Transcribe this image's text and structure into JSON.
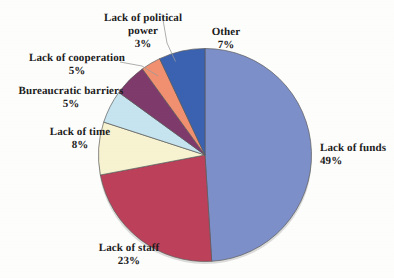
{
  "chart_data": {
    "type": "pie",
    "title": "",
    "subtitle": "",
    "xlabel": "",
    "ylabel": "",
    "legend_position": "none",
    "grid": false,
    "labels_show_percent": true,
    "start_angle_deg": 0,
    "direction": "clockwise",
    "categories": [
      "Lack of funds",
      "Lack of staff",
      "Lack of time",
      "Bureaucratic barriers",
      "Lack of cooperation",
      "Lack of political power",
      "Other"
    ],
    "values": [
      49,
      23,
      8,
      5,
      5,
      3,
      7
    ],
    "unit": "%",
    "total": 100,
    "slices": [
      {
        "label": "Lack of funds",
        "value": 49,
        "percent_text": "49%",
        "color": "#7d8fc9",
        "leader_line": false
      },
      {
        "label": "Lack of staff",
        "value": 23,
        "percent_text": "23%",
        "color": "#bc4059",
        "leader_line": false
      },
      {
        "label": "Lack of time",
        "value": 8,
        "percent_text": "8%",
        "color": "#f7f2d0",
        "leader_line": false
      },
      {
        "label": "Bureaucratic barriers",
        "value": 5,
        "percent_text": "5%",
        "color": "#c5e4ef",
        "leader_line": false
      },
      {
        "label": "Lack of cooperation",
        "value": 5,
        "percent_text": "5%",
        "color": "#7e3a6b",
        "leader_line": true
      },
      {
        "label": "Lack of political power",
        "value": 3,
        "percent_text": "3%",
        "color": "#f09070",
        "leader_line": true
      },
      {
        "label": "Other",
        "value": 7,
        "percent_text": "7%",
        "color": "#3a62b0",
        "leader_line": false
      }
    ]
  },
  "labels": {
    "political_power_line1": "Lack of political",
    "political_power_line2": "power",
    "political_power_pct": "3%",
    "other": "Other",
    "other_pct": "7%",
    "cooperation": "Lack of cooperation",
    "cooperation_pct": "5%",
    "bureaucratic": "Bureaucratic barriers",
    "bureaucratic_pct": "5%",
    "time": "Lack of time",
    "time_pct": "8%",
    "staff": "Lack of staff",
    "staff_pct": "23%",
    "funds": "Lack of funds",
    "funds_pct": "49%"
  },
  "colors": {
    "background": "#fdfdfb",
    "outline": "#5a5a5a",
    "text": "#1b1b1b",
    "funds": "#7d8fc9",
    "staff": "#bc4059",
    "time": "#f7f2d0",
    "bureaucratic": "#c5e4ef",
    "cooperation": "#7e3a6b",
    "political": "#f09070",
    "other": "#3a62b0"
  }
}
